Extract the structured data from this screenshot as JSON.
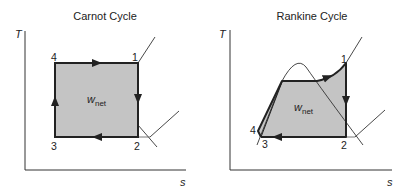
{
  "colors": {
    "fill": "#c4c4c4",
    "line": "#222222",
    "background": "#ffffff"
  },
  "carnot": {
    "title": "Carnot Cycle",
    "y_axis_label": "T",
    "x_axis_label": "s",
    "work_label": "w",
    "work_subscript": "net",
    "points": [
      {
        "id": "1",
        "label": "1"
      },
      {
        "id": "2",
        "label": "2"
      },
      {
        "id": "3",
        "label": "3"
      },
      {
        "id": "4",
        "label": "4"
      }
    ]
  },
  "rankine": {
    "title": "Rankine Cycle",
    "y_axis_label": "T",
    "x_axis_label": "s",
    "work_label": "w",
    "work_subscript": "net",
    "points": [
      {
        "id": "1",
        "label": "1"
      },
      {
        "id": "2",
        "label": "2"
      },
      {
        "id": "3",
        "label": "3"
      },
      {
        "id": "4",
        "label": "4"
      }
    ]
  }
}
